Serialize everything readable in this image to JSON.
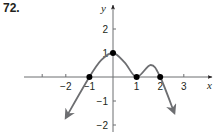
{
  "problem": {
    "number": "72."
  },
  "colors": {
    "curve": "#6d6e71",
    "axis": "#6d6e71",
    "point": "#000000",
    "text": "#231f20"
  },
  "chart_data": {
    "type": "line",
    "title": "",
    "xlabel": "x",
    "ylabel": "y",
    "xlim": [
      -3.7,
      4.2
    ],
    "ylim": [
      -2.3,
      3.0
    ],
    "grid": false,
    "x_ticks": [
      -3,
      -2,
      -1,
      1,
      2,
      3
    ],
    "x_tick_labels": [
      {
        "value": -2,
        "label": "−2"
      },
      {
        "value": -1,
        "label": "−1"
      },
      {
        "value": 1,
        "label": "1"
      },
      {
        "value": 2,
        "label": "2"
      },
      {
        "value": 3,
        "label": "3"
      }
    ],
    "y_ticks": [
      -2,
      -1,
      1,
      2
    ],
    "y_tick_labels": [
      {
        "value": 2,
        "label": "2"
      },
      {
        "value": 1,
        "label": "1"
      },
      {
        "value": -1,
        "label": "−1"
      },
      {
        "value": -2,
        "label": "−2"
      }
    ],
    "marked_points": [
      {
        "x": -1,
        "y": 0
      },
      {
        "x": 0,
        "y": 1
      },
      {
        "x": 1,
        "y": 0
      },
      {
        "x": 2,
        "y": 0
      }
    ],
    "series": [
      {
        "name": "f(x)",
        "description": "Curve with arrows at both ends; crosses x-axis at -1, local max at (0,1), touches x-axis at (1,0), local max near (1.6,0.5), crosses at 2, then decreases",
        "points": [
          {
            "x": -2.0,
            "y": -1.7
          },
          {
            "x": -1.0,
            "y": 0
          },
          {
            "x": -0.5,
            "y": 0.7
          },
          {
            "x": 0,
            "y": 1
          },
          {
            "x": 0.5,
            "y": 0.6
          },
          {
            "x": 1,
            "y": 0
          },
          {
            "x": 1.6,
            "y": 0.5
          },
          {
            "x": 2,
            "y": 0
          },
          {
            "x": 2.6,
            "y": -1.5
          }
        ],
        "end_arrows": true
      }
    ]
  }
}
